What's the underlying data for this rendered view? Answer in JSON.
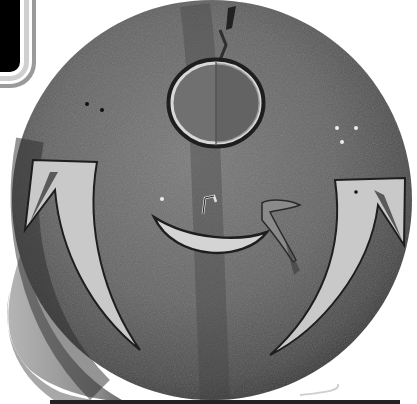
{
  "image": {
    "subject": "painted hide shield",
    "description": "Black-and-white photograph of a round rawhide shield with a painted circle (sun/moon) at top, a crescent smile-like shape in the center with a small nose hook and a bird figure, and two curved horn/claw shapes on left and right sides",
    "colors": {
      "background": "#ffffff",
      "hide_dark": "#3a3a3a",
      "hide_mid": "#6e6e6e",
      "hide_light": "#9a9a9a",
      "paint_light": "#cfcfcf",
      "outline": "#1e1e1e"
    }
  }
}
